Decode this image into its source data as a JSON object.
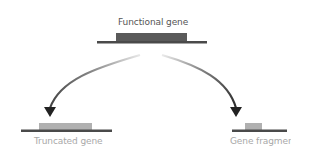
{
  "diagram": {
    "functional_gene": {
      "label": "Functional gene",
      "block_color": "#5a5a5a",
      "line_color": "#4a4a4a"
    },
    "truncated_gene": {
      "label": "Truncated gene",
      "block_color": "#b0b0b0",
      "line_color": "#4a4a4a"
    },
    "gene_fragment": {
      "label": "Gene fragment",
      "block_color": "#b0b0b0",
      "line_color": "#4a4a4a"
    },
    "arrow_color": "#222222"
  }
}
